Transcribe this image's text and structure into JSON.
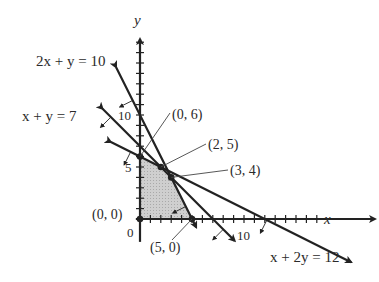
{
  "figure": {
    "axes": {
      "x_label": "x",
      "y_label": "y",
      "origin_label": "0",
      "x_tick_labels": [
        {
          "value": 10,
          "text": "10"
        }
      ],
      "y_tick_labels": [
        {
          "value": 5,
          "text": "5"
        },
        {
          "value": 10,
          "text": "10"
        }
      ],
      "x_range": [
        0,
        22
      ],
      "y_range": [
        0,
        17
      ],
      "tick_step": 1
    },
    "constraints": [
      {
        "id": "c1",
        "equation": "2x + y = 10",
        "a": 2,
        "b": 1,
        "c": 10
      },
      {
        "id": "c2",
        "equation": "x + y = 7",
        "a": 1,
        "b": 1,
        "c": 7
      },
      {
        "id": "c3",
        "equation": "x + 2y = 12",
        "a": 1,
        "b": 2,
        "c": 12
      }
    ],
    "vertices": [
      {
        "label": "(0, 0)",
        "x": 0,
        "y": 0
      },
      {
        "label": "(0, 6)",
        "x": 0,
        "y": 6
      },
      {
        "label": "(2, 5)",
        "x": 2,
        "y": 5
      },
      {
        "label": "(3, 4)",
        "x": 3,
        "y": 4
      },
      {
        "label": "(5, 0)",
        "x": 5,
        "y": 0
      }
    ],
    "shading_color": "#c8c8c8",
    "line_color": "#222222"
  },
  "chart_data": {
    "type": "diagram",
    "title": "",
    "xlabel": "x",
    "ylabel": "y",
    "lines": [
      {
        "equation": "2x + y = 10",
        "x_intercept": 5,
        "y_intercept": 10
      },
      {
        "equation": "x + y = 7",
        "x_intercept": 7,
        "y_intercept": 7
      },
      {
        "equation": "x + 2y = 12",
        "x_intercept": 12,
        "y_intercept": 6
      }
    ],
    "feasible_region_vertices": [
      [
        0,
        0
      ],
      [
        0,
        6
      ],
      [
        2,
        5
      ],
      [
        3,
        4
      ],
      [
        5,
        0
      ]
    ],
    "grid": false
  }
}
